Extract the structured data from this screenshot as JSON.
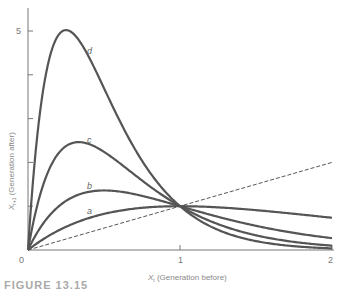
{
  "chart_data": {
    "type": "line",
    "title": "",
    "xlabel": "X_t (Generation before)",
    "ylabel": "X_{t+1} (Generation after)",
    "xlabel_main": "X",
    "xlabel_sub": "t",
    "xlabel_rest": " (Generation before)",
    "ylabel_main": "X",
    "ylabel_sub": "t+1",
    "ylabel_rest": " (Generation after)",
    "xlim": [
      0,
      2
    ],
    "ylim": [
      0,
      5.5
    ],
    "x_ticks": [
      0,
      1,
      2
    ],
    "x_tick_labels": [
      "0",
      "1",
      "2"
    ],
    "y_ticks": [
      0,
      1,
      2,
      3,
      4,
      5
    ],
    "y_tick_labels": [
      "",
      "",
      "",
      "",
      "",
      "5"
    ],
    "origin_label": "0",
    "grid": false,
    "legend": "inline curve labels",
    "series": [
      {
        "name": "a",
        "model": "x*exp(1*(1-x))",
        "r": 1,
        "x": [
          0,
          0.25,
          0.5,
          0.75,
          1,
          1.5,
          2
        ],
        "values": [
          0,
          0.53,
          0.82,
          0.96,
          1.0,
          0.91,
          0.74
        ]
      },
      {
        "name": "b",
        "model": "x*exp(2*(1-x))",
        "r": 2,
        "x": [
          0,
          0.25,
          0.5,
          0.75,
          1,
          1.5,
          2
        ],
        "values": [
          0,
          1.12,
          1.36,
          1.24,
          1.0,
          0.55,
          0.27
        ]
      },
      {
        "name": "c",
        "model": "x*exp(3*(1-x))",
        "r": 3,
        "x": [
          0,
          0.25,
          0.33,
          0.5,
          0.75,
          1,
          1.5,
          2
        ],
        "values": [
          0,
          2.37,
          2.46,
          2.24,
          1.59,
          1.0,
          0.33,
          0.1
        ]
      },
      {
        "name": "d",
        "model": "x*exp(4*(1-x))",
        "r": 4,
        "x": [
          0,
          0.1,
          0.25,
          0.5,
          0.75,
          1,
          1.5,
          2
        ],
        "values": [
          0,
          3.66,
          5.02,
          3.69,
          2.04,
          1.0,
          0.2,
          0.04
        ]
      },
      {
        "name": "replacement line",
        "style": "dashed",
        "x": [
          0,
          2
        ],
        "values": [
          0,
          2
        ]
      }
    ],
    "curve_labels": {
      "a": "a",
      "b": "b",
      "c": "c",
      "d": "d"
    }
  },
  "caption": "FIGURE 13.15"
}
